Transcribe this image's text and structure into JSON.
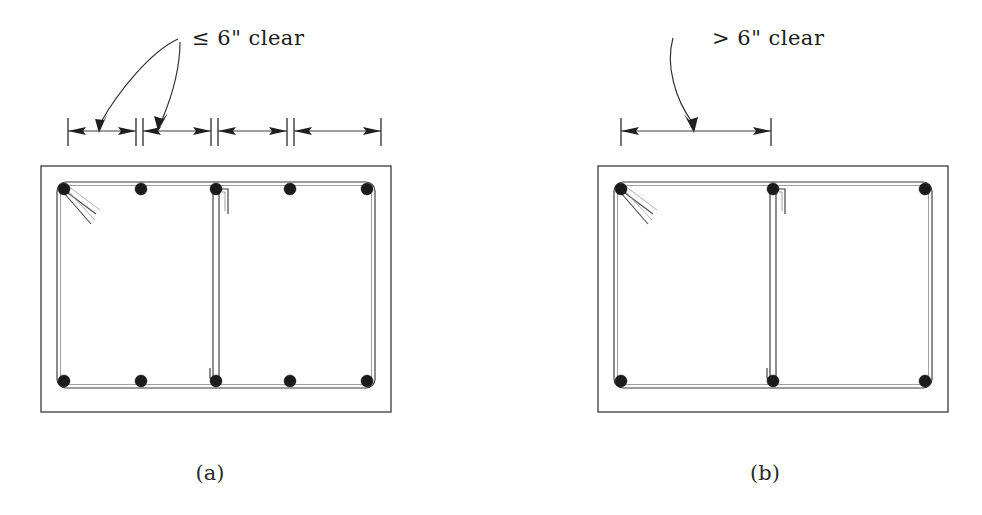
{
  "figure": {
    "background_color": "#ffffff",
    "line_color": "#2b2b2b",
    "rebar_color": "#1b1b1b"
  },
  "panels": [
    {
      "id": "panel-a",
      "caption": "(a)",
      "caption_x": 210,
      "caption_y": 480,
      "annotation": {
        "text": "≤ 6\" clear",
        "symbol": "less-than-or-equal",
        "value": "6\"",
        "unit": "inch",
        "qualifier": "clear",
        "x": 192,
        "y": 45
      },
      "leader_arrows": 2,
      "dimension_segments": 4,
      "dimension_line_y": 131,
      "extension_ticks_x": [
        68,
        136,
        143,
        211,
        218,
        287,
        294,
        381
      ],
      "concrete": {
        "x": 41,
        "y": 166,
        "width": 350,
        "height": 246
      },
      "stirrup": {
        "x": 57,
        "y": 182,
        "width": 318,
        "height": 206,
        "corner_radius": 9
      },
      "center_tie_x": 216,
      "top_bar_positions": [
        64,
        141,
        216,
        290,
        367
      ],
      "bottom_bar_positions": [
        64,
        141,
        216,
        290,
        367
      ],
      "bar_y_top": 189,
      "bar_y_bottom": 381,
      "bar_count": 10,
      "bar_radius": 6
    },
    {
      "id": "panel-b",
      "caption": "(b)",
      "caption_x": 765,
      "caption_y": 480,
      "annotation": {
        "text": "> 6\" clear",
        "symbol": "greater-than",
        "value": "6\"",
        "unit": "inch",
        "qualifier": "clear",
        "x": 712,
        "y": 45
      },
      "leader_arrows": 1,
      "dimension_segments": 1,
      "dimension_line_y": 131,
      "extension_ticks_x": [
        621,
        771
      ],
      "concrete": {
        "x": 598,
        "y": 166,
        "width": 350,
        "height": 246
      },
      "stirrup": {
        "x": 614,
        "y": 182,
        "width": 318,
        "height": 206,
        "corner_radius": 9
      },
      "center_tie_x": 773,
      "top_bar_positions": [
        621,
        773
      ],
      "bottom_bar_positions": [
        621,
        773
      ],
      "bar_y_top": 189,
      "bar_y_bottom": 381,
      "bar_count": 6,
      "bar_radius": 6,
      "corner_bars_right_x": 925
    }
  ]
}
